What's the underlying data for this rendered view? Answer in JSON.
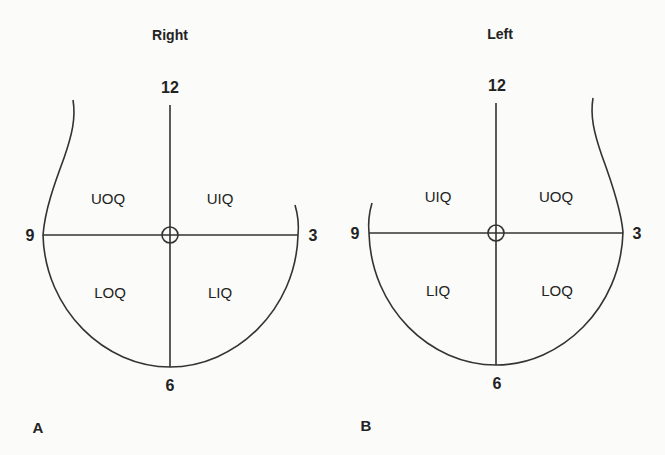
{
  "figure": {
    "panels": [
      {
        "id": "A",
        "panel_label": "A",
        "title": "Right",
        "clock": {
          "top": "12",
          "left": "9",
          "right": "3",
          "bottom": "6"
        },
        "quadrants": {
          "upper_left": "UOQ",
          "upper_right": "UIQ",
          "lower_left": "LOQ",
          "lower_right": "LIQ"
        }
      },
      {
        "id": "B",
        "panel_label": "B",
        "title": "Left",
        "clock": {
          "top": "12",
          "left": "9",
          "right": "3",
          "bottom": "6"
        },
        "quadrants": {
          "upper_left": "UIQ",
          "upper_right": "UOQ",
          "lower_left": "LIQ",
          "lower_right": "LOQ"
        }
      }
    ],
    "line_color": "#333333",
    "background_color": "#fbfbf9"
  }
}
